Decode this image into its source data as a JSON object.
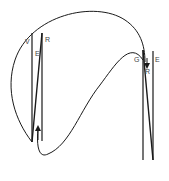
{
  "diagram": {
    "labels": {
      "left_v": "V",
      "left_e": "E",
      "left_r": "R",
      "right_g": "G",
      "right_r": "R",
      "right_e": "E"
    },
    "stroke_color": "#1a1a1a",
    "background": "#ffffff"
  }
}
